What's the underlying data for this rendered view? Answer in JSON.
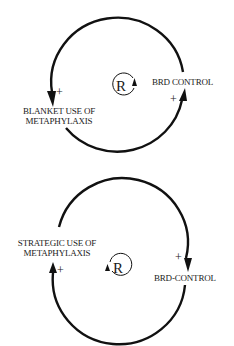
{
  "diagram": {
    "type": "causal-loop-diagram",
    "loops": [
      {
        "id": "top",
        "loop_type": "R",
        "direction": "counterclockwise",
        "variables": [
          {
            "label_line1": "BLANKET USE OF",
            "label_line2": "METAPHYLAXIS"
          },
          {
            "label": "BRD CONTROL"
          }
        ],
        "links": [
          {
            "from": "BRD CONTROL",
            "to": "BLANKET USE OF METAPHYLAXIS",
            "polarity": "+"
          },
          {
            "from": "BLANKET USE OF METAPHYLAXIS",
            "to": "BRD CONTROL",
            "polarity": "+"
          }
        ]
      },
      {
        "id": "bottom",
        "loop_type": "R",
        "direction": "clockwise",
        "variables": [
          {
            "label_line1": "STRATEGIC USE OF",
            "label_line2": "METAPHYLAXIS"
          },
          {
            "label": "BRD-CONTROL"
          }
        ],
        "links": [
          {
            "from": "STRATEGIC USE OF METAPHYLAXIS",
            "to": "BRD-CONTROL",
            "polarity": "+"
          },
          {
            "from": "BRD-CONTROL",
            "to": "STRATEGIC USE OF METAPHYLAXIS",
            "polarity": "+"
          }
        ]
      }
    ]
  }
}
